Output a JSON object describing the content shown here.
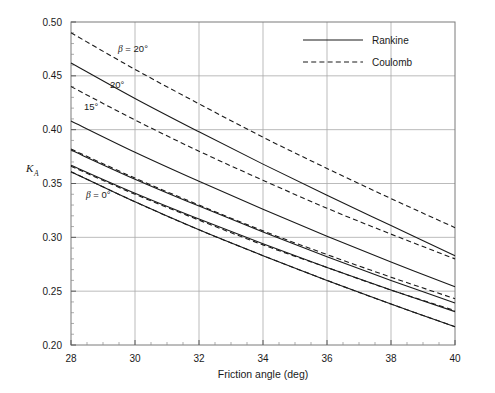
{
  "figure": {
    "background_color": "#ffffff",
    "frame_color": "#7a7a7a",
    "grid_color": "#aaaaaa",
    "curve_color": "#1a1a1a"
  },
  "axes": {
    "y_label_main": "K",
    "y_label_sub": "A",
    "x_title": "Friction angle (deg)",
    "x_ticks": [
      "28",
      "30",
      "32",
      "34",
      "36",
      "38",
      "40"
    ],
    "y_ticks": [
      "0.20",
      "0.25",
      "0.30",
      "0.35",
      "0.40",
      "0.45",
      "0.50"
    ]
  },
  "legend": {
    "items": [
      {
        "label": "Rankine",
        "style": "solid"
      },
      {
        "label": "Coulomb",
        "style": "dashed"
      }
    ]
  },
  "annotations": [
    {
      "name": "beta-20-coulomb-label",
      "text": "β = 20°",
      "x": 118,
      "y": 52
    },
    {
      "name": "beta-20-rankine-label",
      "text": "20°",
      "x": 110,
      "y": 88
    },
    {
      "name": "beta-15-label",
      "text": "15°",
      "x": 84,
      "y": 110
    },
    {
      "name": "beta-0-label",
      "text": "β = 0°",
      "x": 86,
      "y": 198
    }
  ],
  "chart_data": {
    "type": "line",
    "title": "",
    "xlabel": "Friction angle (deg)",
    "ylabel": "K_A",
    "xlim": [
      28,
      40
    ],
    "ylim": [
      0.2,
      0.5
    ],
    "grid": true,
    "legend_position": "top-right",
    "x": [
      28,
      30,
      32,
      34,
      36,
      38,
      40
    ],
    "series": [
      {
        "name": "Rankine beta = 20",
        "style": "solid",
        "beta_deg": 20,
        "values": [
          0.462,
          0.429,
          0.398,
          0.368,
          0.339,
          0.311,
          0.283
        ]
      },
      {
        "name": "Coulomb beta = 20",
        "style": "dashed",
        "beta_deg": 20,
        "values": [
          0.49,
          0.456,
          0.424,
          0.393,
          0.364,
          0.336,
          0.309
        ]
      },
      {
        "name": "Rankine beta = 15",
        "style": "solid",
        "beta_deg": 15,
        "values": [
          0.408,
          0.379,
          0.352,
          0.326,
          0.301,
          0.277,
          0.254
        ]
      },
      {
        "name": "Coulomb beta = 15",
        "style": "dashed",
        "beta_deg": 15,
        "values": [
          0.44,
          0.409,
          0.38,
          0.353,
          0.327,
          0.303,
          0.28
        ]
      },
      {
        "name": "Rankine beta = 10",
        "style": "solid",
        "beta_deg": 10,
        "values": [
          0.381,
          0.354,
          0.329,
          0.305,
          0.282,
          0.26,
          0.239
        ]
      },
      {
        "name": "Coulomb beta = 10",
        "style": "dashed",
        "beta_deg": 10,
        "values": [
          0.382,
          0.355,
          0.33,
          0.306,
          0.284,
          0.263,
          0.243
        ]
      },
      {
        "name": "Rankine beta = 5",
        "style": "solid",
        "beta_deg": 5,
        "values": [
          0.367,
          0.341,
          0.317,
          0.294,
          0.272,
          0.251,
          0.231
        ]
      },
      {
        "name": "Coulomb beta = 5",
        "style": "dashed",
        "beta_deg": 5,
        "values": [
          0.366,
          0.34,
          0.316,
          0.293,
          0.272,
          0.251,
          0.232
        ]
      },
      {
        "name": "Rankine beta = 0",
        "style": "solid",
        "beta_deg": 0,
        "values": [
          0.361,
          0.333,
          0.307,
          0.283,
          0.26,
          0.238,
          0.217
        ]
      },
      {
        "name": "Coulomb beta = 0",
        "style": "dashed",
        "beta_deg": 0,
        "values": [
          0.361,
          0.333,
          0.307,
          0.283,
          0.26,
          0.238,
          0.217
        ]
      }
    ]
  }
}
